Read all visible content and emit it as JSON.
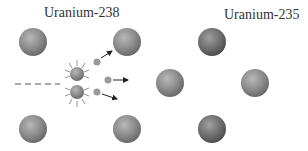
{
  "labels": {
    "left": "Uranium-238",
    "right": "Uranium-235"
  },
  "colors": {
    "u238": "#8a8a8a",
    "u235": "#6e6e6e",
    "neutron": "#9a9a9a",
    "arrow": "#222222",
    "dash": "#555555"
  }
}
